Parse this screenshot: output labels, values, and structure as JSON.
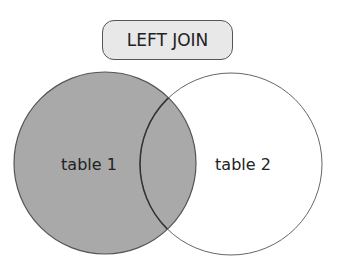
{
  "title": "LEFT JOIN",
  "circles": [
    {
      "label": "table 1",
      "fill": "#a9a9a9"
    },
    {
      "label": "table 2",
      "fill": "#ffffff"
    }
  ],
  "colors": {
    "stroke": "#444444",
    "title_bg": "#e8e8e8"
  }
}
